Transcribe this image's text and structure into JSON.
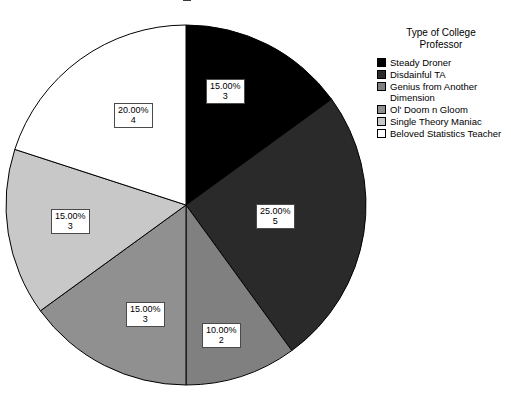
{
  "title_fragment": ".",
  "legend": {
    "title_line1": "Type of College",
    "title_line2": "Professor"
  },
  "chart_data": {
    "type": "pie",
    "title": "",
    "legend_title": "Type of College Professor",
    "legend_position": "right",
    "total_count": 20,
    "start_angle_deg": 0,
    "direction": "clockwise",
    "categories": [
      "Steady Droner",
      "Disdainful TA",
      "Genius from Another Dimension",
      "Ol' Doom n Gloom",
      "Single Theory Maniac",
      "Beloved Statistics Teacher"
    ],
    "values": [
      15.0,
      25.0,
      10.0,
      15.0,
      15.0,
      20.0
    ],
    "counts": [
      3,
      5,
      2,
      3,
      3,
      4
    ],
    "colors": [
      "#000000",
      "#2a2a2a",
      "#808080",
      "#909090",
      "#c8c8c8",
      "#ffffff"
    ],
    "slices": [
      {
        "label": "Steady Droner",
        "percent_text": "15.00%",
        "count_text": "3",
        "percent": 15.0,
        "count": 3,
        "color": "#000000",
        "legend_label": "Steady Droner"
      },
      {
        "label": "Disdainful TA",
        "percent_text": "25.00%",
        "count_text": "5",
        "percent": 25.0,
        "count": 5,
        "color": "#2a2a2a",
        "legend_label": "Disdainful TA"
      },
      {
        "label": "Genius from Another Dimension",
        "percent_text": "10.00%",
        "count_text": "2",
        "percent": 10.0,
        "count": 2,
        "color": "#808080",
        "legend_label_line1": "Genius from Another",
        "legend_label_line2": "Dimension"
      },
      {
        "label": "Ol' Doom n Gloom",
        "percent_text": "15.00%",
        "count_text": "3",
        "percent": 15.0,
        "count": 3,
        "color": "#909090",
        "legend_label": "Ol' Doom n Gloom"
      },
      {
        "label": "Single Theory Maniac",
        "percent_text": "15.00%",
        "count_text": "3",
        "percent": 15.0,
        "count": 3,
        "color": "#c8c8c8",
        "legend_label": "Single Theory Maniac"
      },
      {
        "label": "Beloved Statistics Teacher",
        "percent_text": "20.00%",
        "count_text": "4",
        "percent": 20.0,
        "count": 4,
        "color": "#ffffff",
        "legend_label": "Beloved Statistics Teacher"
      }
    ]
  }
}
